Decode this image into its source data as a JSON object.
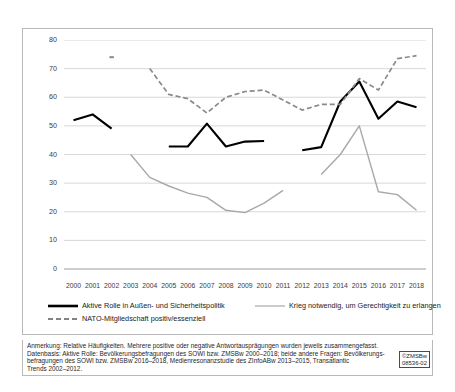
{
  "chart_data": {
    "type": "line",
    "title": "",
    "xlabel": "",
    "ylabel": "",
    "ylim": [
      0,
      80
    ],
    "yticks": [
      0,
      10,
      20,
      30,
      40,
      50,
      60,
      70,
      80
    ],
    "grid": true,
    "legend_position": "bottom",
    "categories": [
      "2000",
      "2001",
      "2002",
      "2003",
      "2004",
      "2005",
      "2006",
      "2007",
      "2008",
      "2009",
      "2010",
      "2011",
      "2012",
      "2013",
      "2014",
      "2015",
      "2016",
      "2017",
      "2018"
    ],
    "series": [
      {
        "name": "Aktive Rolle in Außen- und Sicherheitspolitik",
        "style": "solid",
        "color": "#000000",
        "values": [
          52,
          54,
          49,
          null,
          null,
          42.8,
          42.8,
          50.8,
          42.8,
          44.5,
          44.7,
          null,
          41.5,
          42.6,
          58.5,
          65.5,
          52.5,
          58.5,
          56.5
        ]
      },
      {
        "name": "Krieg notwendig, um Gerechtigkeit zu erlangen",
        "style": "solid",
        "color": "#a8a8a8",
        "values": [
          null,
          null,
          null,
          40,
          32,
          29,
          26.5,
          25,
          20.5,
          19.7,
          23,
          27.5,
          null,
          33,
          40,
          50,
          27,
          26,
          20.5
        ]
      },
      {
        "name": "NATO-Mitgliedschaft positiv/essenziell",
        "style": "dashed",
        "color": "#8a8a8a",
        "values": [
          null,
          null,
          74,
          null,
          70,
          61,
          59.5,
          54.5,
          60,
          62,
          62.5,
          59,
          55.5,
          57.5,
          57.5,
          66.5,
          62.5,
          73.5,
          74.5
        ]
      }
    ]
  },
  "legend": {
    "items": [
      {
        "label": "Aktive Rolle in Außen- und Sicherheitspolitik",
        "style": "solid-black"
      },
      {
        "label": "Krieg notwendig, um Gerechtigkeit zu erlangen",
        "style": "solid-gray"
      },
      {
        "label": "NATO-Mitgliedschaft positiv/essenziell",
        "style": "dashed-gray"
      }
    ]
  },
  "note": {
    "line1": "Anmerkung: Relative Häufigkeiten. Mehrere positive oder negative Antwortausprägungen wurden jeweils zusammengefasst.",
    "line2": "Datenbasis: Aktive Rolle: Bevölkerungsbefragungen des SOWI bzw. ZMSBw 2000–2018; beide andere Fragen: Bevölkerungs-",
    "line3": "befragungen des SOWI bzw. ZMSBw 2016–2018, Medienresonanzstudie des ZInfoABw 2013–2015, Transatlantic",
    "line4": "Trends 2002–2012."
  },
  "credit": {
    "line1": "©ZMSBw",
    "line2": "08536-02"
  }
}
